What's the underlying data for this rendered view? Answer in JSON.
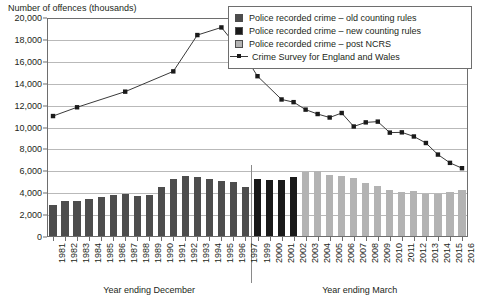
{
  "chart_data": {
    "type": "bar",
    "title": "",
    "ylabel": "Number of offences (thousands)",
    "xlabel_left": "Year ending December",
    "xlabel_right": "Year ending March",
    "ylim": [
      0,
      20000
    ],
    "ytick_values": [
      0,
      2000,
      4000,
      6000,
      8000,
      10000,
      12000,
      14000,
      16000,
      18000,
      20000
    ],
    "ytick_labels": [
      "0",
      "2,000",
      "4,000",
      "6,000",
      "8,000",
      "10,000",
      "12,000",
      "14,000",
      "16,000",
      "18,000",
      "20,000"
    ],
    "grid": true,
    "legend_position": "top-right",
    "categories": [
      "1981",
      "1982",
      "1983",
      "1984",
      "1985",
      "1986",
      "1987",
      "1988",
      "1989",
      "1990",
      "1991",
      "1992",
      "1993",
      "1994",
      "1995",
      "1996",
      "1997",
      "1999",
      "2000",
      "2001",
      "2002",
      "2003",
      "2004",
      "2005",
      "2006",
      "2007",
      "2008",
      "2009",
      "2010",
      "2011",
      "2012",
      "2013",
      "2014",
      "2015",
      "2016"
    ],
    "december_years": [
      "1981",
      "1982",
      "1983",
      "1984",
      "1985",
      "1986",
      "1987",
      "1988",
      "1989",
      "1990",
      "1991",
      "1992",
      "1993",
      "1994",
      "1995",
      "1996",
      "1997"
    ],
    "march_years": [
      "1999",
      "2000",
      "2001",
      "2002",
      "2003",
      "2004",
      "2005",
      "2006",
      "2007",
      "2008",
      "2009",
      "2010",
      "2011",
      "2012",
      "2013",
      "2014",
      "2015",
      "2016"
    ],
    "series": [
      {
        "name": "Police recorded crime – old counting rules",
        "type": "bar",
        "color": "#4d4d4d",
        "data": {
          "1981": 2964,
          "1982": 3262,
          "1983": 3247,
          "1984": 3499,
          "1985": 3612,
          "1986": 3847,
          "1987": 3892,
          "1988": 3716,
          "1989": 3871,
          "1990": 4544,
          "1991": 5276,
          "1992": 5592,
          "1993": 5526,
          "1994": 5253,
          "1995": 5100,
          "1996": 4981,
          "1997": 4598
        }
      },
      {
        "name": "Police recorded crime – new counting rules",
        "type": "bar",
        "color": "#1a1a1a",
        "data": {
          "1999": 5301,
          "2000": 5171,
          "2001": 5170,
          "2002": 5525
        }
      },
      {
        "name": "Police recorded crime – post NCRS",
        "type": "bar",
        "color": "#b3b3b3",
        "data": {
          "2003": 5975,
          "2004": 6014,
          "2005": 5637,
          "2006": 5555,
          "2007": 5428,
          "2008": 4951,
          "2009": 4703,
          "2010": 4338,
          "2011": 4151,
          "2012": 4214,
          "2013": 3944,
          "2014": 3938,
          "2015": 4106,
          "2016": 4297
        }
      },
      {
        "name": "Crime Survey for England and Wales",
        "type": "line",
        "color": "#3a3a3a",
        "marker": "square",
        "data": {
          "1981": 11045,
          "1983": 11847,
          "1987": 13274,
          "1991": 15126,
          "1993": 18442,
          "1995": 19139,
          "1997": 16437,
          "1999": 14685,
          "2001": 12560,
          "2002": 12316,
          "2003": 11632,
          "2004": 11230,
          "2005": 10912,
          "2006": 11324,
          "2007": 10092,
          "2008": 10468,
          "2009": 10536,
          "2010": 9532,
          "2011": 9557,
          "2012": 9180,
          "2013": 8584,
          "2014": 7528,
          "2015": 6770,
          "2016": 6283
        }
      }
    ]
  },
  "legend": {
    "items": [
      {
        "label": "Police recorded crime – old counting rules",
        "swatch": "#4d4d4d",
        "kind": "swatch"
      },
      {
        "label": "Police recorded crime – new counting rules",
        "swatch": "#1a1a1a",
        "kind": "swatch"
      },
      {
        "label": "Police recorded crime – post NCRS",
        "swatch": "#b3b3b3",
        "kind": "swatch"
      },
      {
        "label": "Crime Survey for England and Wales",
        "swatch": "#3a3a3a",
        "kind": "line"
      }
    ]
  }
}
